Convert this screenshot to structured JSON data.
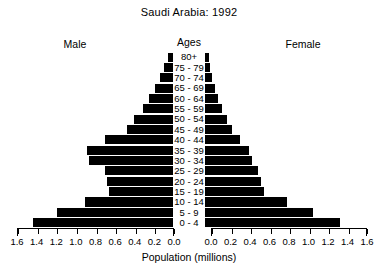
{
  "chart_data": {
    "type": "bar",
    "subtype": "population-pyramid",
    "title": "Saudi Arabia: 1992",
    "xlabel": "Population (millions)",
    "ylabel": "Ages",
    "center_axis_label": "Ages",
    "left_series_label": "Male",
    "right_series_label": "Female",
    "grid": false,
    "legend_position": "none",
    "bar_color": "#000000",
    "xlim": [
      0,
      1.6
    ],
    "xticks": [
      0.0,
      0.2,
      0.4,
      0.6,
      0.8,
      1.0,
      1.2,
      1.4,
      1.6
    ],
    "left_xticklabels": [
      "1.6",
      "1.4",
      "1.2",
      "1.0",
      "0.8",
      "0.6",
      "0.4",
      "0.2",
      "0.0"
    ],
    "right_xticklabels": [
      "0.0",
      "0.2",
      "0.4",
      "0.6",
      "0.8",
      "1.0",
      "1.2",
      "1.4",
      "1.6"
    ],
    "categories": [
      "80+",
      "75 - 79",
      "70 - 74",
      "65 - 69",
      "60 - 64",
      "55 - 59",
      "50 - 54",
      "45 - 49",
      "40 - 44",
      "35 - 39",
      "30 - 34",
      "25 - 29",
      "20 - 24",
      "15 - 19",
      "10 - 14",
      "5 - 9",
      "0 - 4"
    ],
    "series": [
      {
        "name": "Male",
        "side": "left",
        "values": [
          0.05,
          0.09,
          0.13,
          0.18,
          0.25,
          0.31,
          0.4,
          0.47,
          0.7,
          0.88,
          0.86,
          0.7,
          0.68,
          0.66,
          0.9,
          1.19,
          1.44
        ]
      },
      {
        "name": "Female",
        "side": "right",
        "values": [
          0.04,
          0.05,
          0.07,
          0.1,
          0.13,
          0.17,
          0.23,
          0.28,
          0.36,
          0.45,
          0.48,
          0.54,
          0.57,
          0.61,
          0.84,
          1.11,
          1.38
        ]
      }
    ]
  },
  "header": {
    "title": "Saudi Arabia: 1992"
  },
  "labels": {
    "male": "Male",
    "female": "Female",
    "ages": "Ages",
    "population": "Population (millions)"
  }
}
